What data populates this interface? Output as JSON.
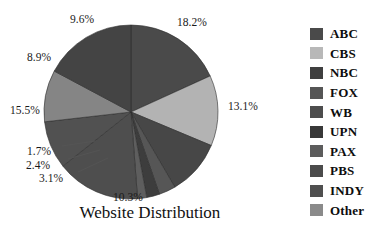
{
  "chart_data": {
    "type": "pie",
    "title": "Website Distribution",
    "xlabel": "",
    "ylabel": "",
    "legend_position": "right",
    "grid": false,
    "start_angle_deg": 0,
    "direction": "clockwise",
    "categories": [
      "ABC",
      "CBS",
      "NBC",
      "FOX",
      "WB",
      "UPN",
      "PAX",
      "PBS",
      "INDY",
      "Other"
    ],
    "values": [
      18.2,
      13.1,
      10.3,
      3.1,
      2.4,
      1.7,
      15.5,
      8.9,
      9.6,
      17.2
    ],
    "labels": [
      "18.2%",
      "13.1%",
      "10.3%",
      "3.1%",
      "2.4%",
      "1.7%",
      "15.5%",
      "8.9%",
      "9.6%"
    ],
    "slices": [
      {
        "name": "ABC",
        "label": "18.2%",
        "value": 18.2,
        "color": "#4a4a4a"
      },
      {
        "name": "CBS",
        "label": "13.1%",
        "value": 13.1,
        "color": "#b3b3b3"
      },
      {
        "name": "NBC",
        "label": "10.3%",
        "value": 10.3,
        "color": "#474747"
      },
      {
        "name": "FOX",
        "label": "3.1%",
        "value": 3.1,
        "color": "#565656"
      },
      {
        "name": "WB",
        "label": "2.4%",
        "value": 2.4,
        "color": "#3d3d3d"
      },
      {
        "name": "UPN",
        "label": "1.7%",
        "value": 1.7,
        "color": "#5e5e5e"
      },
      {
        "name": "PAX",
        "label": "15.5%",
        "value": 15.5,
        "color": "#4e4e4e"
      },
      {
        "name": "PBS",
        "label": "8.9%",
        "value": 8.9,
        "color": "#515151"
      },
      {
        "name": "INDY",
        "label": "9.6%",
        "value": 9.6,
        "color": "#858585"
      },
      {
        "name": "Other",
        "label": "",
        "value": 17.2,
        "color": "#444444"
      }
    ]
  },
  "legend": {
    "items": [
      {
        "label": "ABC",
        "color": "#4a4a4a"
      },
      {
        "label": "CBS",
        "color": "#b8b8b8"
      },
      {
        "label": "NBC",
        "color": "#3f3f3f"
      },
      {
        "label": "FOX",
        "color": "#555555"
      },
      {
        "label": "WB",
        "color": "#4d4d4d"
      },
      {
        "label": "UPN",
        "color": "#383838"
      },
      {
        "label": "PAX",
        "color": "#5c5c5c"
      },
      {
        "label": "PBS",
        "color": "#4b4b4b"
      },
      {
        "label": "INDY",
        "color": "#4f4f4f"
      },
      {
        "label": "Other",
        "color": "#8a8a8a"
      }
    ]
  },
  "pct_labels": [
    {
      "text": "18.2%",
      "x": 177,
      "y": 17
    },
    {
      "text": "13.1%",
      "x": 228,
      "y": 101
    },
    {
      "text": "10.3%",
      "x": 113,
      "y": 192
    },
    {
      "text": "3.1%",
      "x": 39,
      "y": 173
    },
    {
      "text": "2.4%",
      "x": 26,
      "y": 160
    },
    {
      "text": "1.7%",
      "x": 27,
      "y": 146
    },
    {
      "text": "15.5%",
      "x": 10,
      "y": 105
    },
    {
      "text": "8.9%",
      "x": 27,
      "y": 52
    },
    {
      "text": "9.6%",
      "x": 70,
      "y": 14
    }
  ],
  "title": {
    "text": "Website Distribution"
  }
}
